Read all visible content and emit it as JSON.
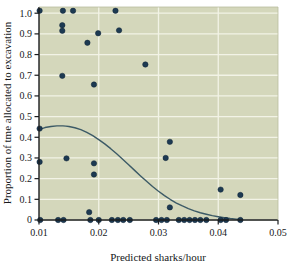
{
  "figure": {
    "background_color": "#ffffff",
    "plot_background_color": "#d4d7bb",
    "grid_color": "#f2f3e6",
    "point_color": "#1d3a52",
    "point_edge_color": "#0f2336",
    "curve_color": "#3c5a66",
    "axis_color": "#1a1c1e"
  },
  "chart_data": {
    "type": "scatter",
    "title": "",
    "xlabel": "Predicted sharks/hour",
    "ylabel": "Proportion of tme allocated to excavation",
    "xlim": [
      0.01,
      0.05
    ],
    "ylim": [
      0.0,
      1.03
    ],
    "grid": true,
    "legend": null,
    "xticks": [
      0.01,
      0.02,
      0.03,
      0.04,
      0.05
    ],
    "xtick_labels": [
      "0.01",
      "0.02",
      "0.03",
      "0.04",
      "0.05"
    ],
    "yticks": [
      0.0,
      0.1,
      0.2,
      0.3,
      0.4,
      0.5,
      0.6,
      0.7,
      0.8,
      0.9,
      1.0
    ],
    "ytick_labels": [
      "0",
      "0.1",
      "0.2",
      "0.3",
      "0.4",
      "0.5",
      "0.6",
      "0.7",
      "0.8",
      "0.9",
      "1.0"
    ],
    "points": [
      [
        0.0101,
        1.012
      ],
      [
        0.014,
        1.012
      ],
      [
        0.0157,
        1.012
      ],
      [
        0.0228,
        1.012
      ],
      [
        0.0139,
        0.942
      ],
      [
        0.0139,
        0.915
      ],
      [
        0.0234,
        0.917
      ],
      [
        0.0199,
        0.903
      ],
      [
        0.0181,
        0.857
      ],
      [
        0.0278,
        0.752
      ],
      [
        0.0139,
        0.697
      ],
      [
        0.0192,
        0.655
      ],
      [
        0.0101,
        0.442
      ],
      [
        0.0319,
        0.378
      ],
      [
        0.0146,
        0.298
      ],
      [
        0.0312,
        0.3
      ],
      [
        0.0101,
        0.281
      ],
      [
        0.0192,
        0.274
      ],
      [
        0.0192,
        0.22
      ],
      [
        0.0404,
        0.147
      ],
      [
        0.0437,
        0.121
      ],
      [
        0.0319,
        0.061
      ],
      [
        0.0184,
        0.038
      ],
      [
        0.0102,
        0.0
      ],
      [
        0.0132,
        0.0
      ],
      [
        0.0141,
        0.0
      ],
      [
        0.0186,
        0.0
      ],
      [
        0.02,
        0.0
      ],
      [
        0.0222,
        0.0
      ],
      [
        0.0232,
        0.0
      ],
      [
        0.0241,
        0.0
      ],
      [
        0.0252,
        0.0
      ],
      [
        0.0296,
        0.0
      ],
      [
        0.0305,
        0.0
      ],
      [
        0.0314,
        0.0
      ],
      [
        0.0334,
        0.0
      ],
      [
        0.0343,
        0.0
      ],
      [
        0.0352,
        0.0
      ],
      [
        0.0361,
        0.0
      ],
      [
        0.037,
        0.0
      ],
      [
        0.038,
        0.0
      ],
      [
        0.0404,
        0.0
      ],
      [
        0.0413,
        0.0
      ],
      [
        0.0437,
        0.0
      ]
    ],
    "fit_curve": {
      "name": "fitted logistic trend",
      "x": [
        0.01,
        0.011,
        0.012,
        0.013,
        0.014,
        0.0145,
        0.015,
        0.016,
        0.017,
        0.018,
        0.019,
        0.02,
        0.021,
        0.022,
        0.023,
        0.024,
        0.025,
        0.026,
        0.027,
        0.028,
        0.029,
        0.03,
        0.031,
        0.032,
        0.033,
        0.034,
        0.035,
        0.036,
        0.037,
        0.038,
        0.039,
        0.04,
        0.041,
        0.042,
        0.043,
        0.044
      ],
      "y": [
        0.437,
        0.447,
        0.452,
        0.455,
        0.455,
        0.454,
        0.452,
        0.446,
        0.437,
        0.424,
        0.408,
        0.389,
        0.368,
        0.345,
        0.32,
        0.294,
        0.267,
        0.24,
        0.213,
        0.187,
        0.162,
        0.139,
        0.118,
        0.099,
        0.082,
        0.068,
        0.055,
        0.044,
        0.035,
        0.028,
        0.021,
        0.016,
        0.011,
        0.007,
        0.004,
        0.001
      ]
    }
  }
}
